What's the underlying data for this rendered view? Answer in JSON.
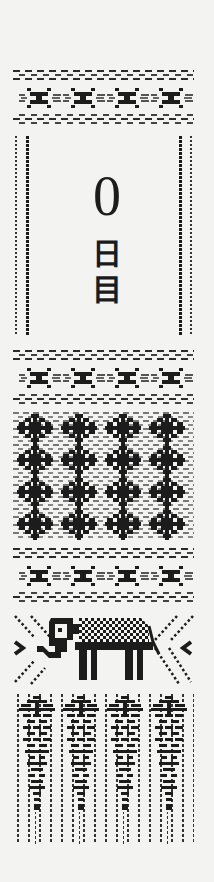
{
  "page": {
    "kind": "woven bookmark pattern sheet",
    "background_color": "#f3f3f2",
    "ink_color": "#1c1c1c"
  },
  "title": {
    "number": "0",
    "suffix_chars": [
      "日",
      "目"
    ],
    "full_text": "0日目"
  },
  "sections": [
    {
      "name": "top-x-band",
      "motif": "x-motif",
      "repeat": 4
    },
    {
      "name": "title-frame",
      "motif": "dotted-double-border"
    },
    {
      "name": "middle-x-band",
      "motif": "x-motif",
      "repeat": 4
    },
    {
      "name": "diamond-check-band",
      "motif": "diamond-check",
      "columns": 4,
      "rows": 4
    },
    {
      "name": "lower-x-band",
      "motif": "x-motif",
      "repeat": 4
    },
    {
      "name": "elephant-band",
      "motif": "elephant",
      "repeat": 1
    },
    {
      "name": "tassel-band",
      "motif": "tassel-drop",
      "repeat": 4
    }
  ]
}
